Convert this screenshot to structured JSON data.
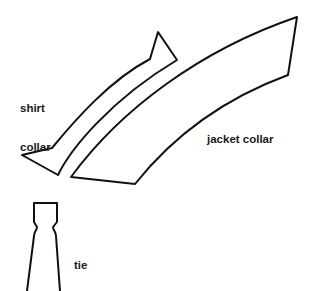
{
  "diagram": {
    "labels": {
      "shirt_collar_line1": "shirt",
      "shirt_collar_line2": "collar",
      "jacket_collar": "jacket collar",
      "tie": "tie"
    },
    "shapes": [
      {
        "name": "shirt-collar",
        "type": "pattern-piece"
      },
      {
        "name": "jacket-collar",
        "type": "pattern-piece"
      },
      {
        "name": "tie",
        "type": "pattern-piece"
      }
    ],
    "colors": {
      "stroke": "#111111",
      "text": "#1a1a1a",
      "background": "#ffffff"
    }
  }
}
